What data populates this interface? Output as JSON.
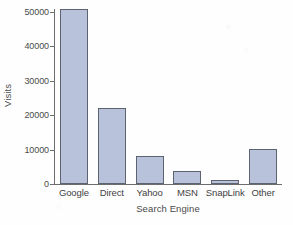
{
  "chart_data": {
    "type": "bar",
    "title": "",
    "xlabel": "Search Engine",
    "ylabel": "Visits",
    "categories": [
      "Google",
      "Direct",
      "Yahoo",
      "MSN",
      "SnapLink",
      "Other"
    ],
    "values": [
      50800,
      22200,
      8000,
      3800,
      1300,
      10200
    ],
    "ylim": [
      0,
      50000
    ],
    "yticks": [
      0,
      10000,
      20000,
      30000,
      40000,
      50000
    ],
    "ytick_labels": [
      "0",
      "10000",
      "20000",
      "30000",
      "40000",
      "50000"
    ],
    "grid": false,
    "legend": null,
    "bar_fill_color": "#b9c2db",
    "bar_border_color": "#5e6370",
    "axis_color": "#6d6d6d",
    "background_color": "#ffffff"
  }
}
